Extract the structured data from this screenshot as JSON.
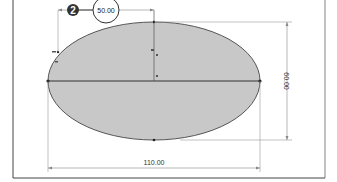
{
  "sketch": {
    "shape": "ellipse",
    "fill_color": "#c8c8c8",
    "outline_color": "#555555",
    "frame_color": "#444444"
  },
  "dimensions": {
    "top_half_width": {
      "value": "50.00"
    },
    "height": {
      "value": "60.00"
    },
    "width": {
      "value": "110.00"
    }
  },
  "callout": {
    "step_number": "2",
    "badge_color": "#333333"
  }
}
